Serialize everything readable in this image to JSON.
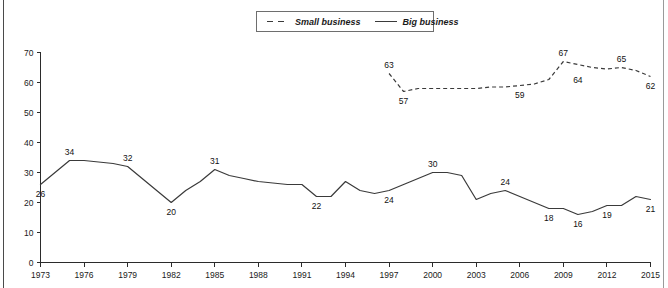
{
  "legend": {
    "position": "top-center",
    "entries": [
      {
        "label": "Small business",
        "style": "dashed",
        "swatch_name": "legend-swatch-dashed"
      },
      {
        "label": "Big business",
        "style": "solid",
        "swatch_name": "legend-swatch-solid"
      }
    ]
  },
  "axes": {
    "y_ticks": [
      "0",
      "10",
      "20",
      "30",
      "40",
      "50",
      "60",
      "70"
    ],
    "x_ticks": [
      "1973",
      "1976",
      "1979",
      "1982",
      "1985",
      "1988",
      "1991",
      "1994",
      "1997",
      "2000",
      "2003",
      "2006",
      "2009",
      "2012",
      "2015"
    ]
  },
  "chart_data": {
    "type": "line",
    "title": "",
    "xlabel": "",
    "ylabel": "",
    "xlim": [
      1973,
      2015
    ],
    "ylim": [
      0,
      70
    ],
    "grid": false,
    "legend_position": "top-center",
    "x": [
      1973,
      1974,
      1975,
      1976,
      1977,
      1978,
      1979,
      1980,
      1981,
      1982,
      1983,
      1984,
      1985,
      1986,
      1987,
      1988,
      1989,
      1990,
      1991,
      1992,
      1993,
      1994,
      1995,
      1996,
      1997,
      1998,
      1999,
      2000,
      2001,
      2002,
      2003,
      2004,
      2005,
      2006,
      2007,
      2008,
      2009,
      2010,
      2011,
      2012,
      2013,
      2014,
      2015
    ],
    "series": [
      {
        "name": "Big business",
        "style": "solid",
        "x": [
          1973,
          1974,
          1975,
          1976,
          1977,
          1978,
          1979,
          1980,
          1981,
          1982,
          1983,
          1984,
          1985,
          1986,
          1987,
          1988,
          1989,
          1990,
          1991,
          1992,
          1993,
          1994,
          1995,
          1996,
          1997,
          1998,
          1999,
          2000,
          2001,
          2002,
          2003,
          2004,
          2005,
          2006,
          2007,
          2008,
          2009,
          2010,
          2011,
          2012,
          2013,
          2014,
          2015
        ],
        "values": [
          26,
          30,
          34,
          34,
          33.5,
          33,
          32,
          28,
          24,
          20,
          24,
          27,
          31,
          29,
          28,
          27,
          26.5,
          26,
          26,
          22,
          22,
          27,
          24,
          23,
          24,
          26,
          28,
          30,
          30,
          29,
          21,
          23,
          24,
          22,
          20,
          18,
          18,
          16,
          17,
          19,
          19,
          22,
          21
        ]
      },
      {
        "name": "Small business",
        "style": "dashed",
        "x": [
          1997,
          1998,
          1999,
          2000,
          2001,
          2002,
          2003,
          2004,
          2005,
          2006,
          2007,
          2008,
          2009,
          2010,
          2011,
          2012,
          2013,
          2014,
          2015
        ],
        "values": [
          63,
          57,
          58,
          58,
          58,
          58,
          58,
          58.5,
          58.5,
          59,
          59.5,
          61,
          67,
          66,
          65,
          64.5,
          65,
          64,
          62
        ]
      }
    ],
    "point_labels": [
      {
        "series": "Big business",
        "x": 1973,
        "value": 26,
        "text": "26",
        "position": "below"
      },
      {
        "series": "Big business",
        "x": 1975,
        "value": 34,
        "text": "34",
        "position": "above"
      },
      {
        "series": "Big business",
        "x": 1979,
        "value": 32,
        "text": "32",
        "position": "above"
      },
      {
        "series": "Big business",
        "x": 1982,
        "value": 20,
        "text": "20",
        "position": "below"
      },
      {
        "series": "Big business",
        "x": 1985,
        "value": 31,
        "text": "31",
        "position": "above"
      },
      {
        "series": "Big business",
        "x": 1992,
        "value": 22,
        "text": "22",
        "position": "below"
      },
      {
        "series": "Big business",
        "x": 1997,
        "value": 24,
        "text": "24",
        "position": "below"
      },
      {
        "series": "Big business",
        "x": 2000,
        "value": 30,
        "text": "30",
        "position": "above"
      },
      {
        "series": "Big business",
        "x": 2005,
        "value": 24,
        "text": "24",
        "position": "above"
      },
      {
        "series": "Big business",
        "x": 2008,
        "value": 18,
        "text": "18",
        "position": "below"
      },
      {
        "series": "Big business",
        "x": 2010,
        "value": 16,
        "text": "16",
        "position": "below"
      },
      {
        "series": "Big business",
        "x": 2012,
        "value": 19,
        "text": "19",
        "position": "below"
      },
      {
        "series": "Big business",
        "x": 2015,
        "value": 21,
        "text": "21",
        "position": "below"
      },
      {
        "series": "Small business",
        "x": 1997,
        "value": 63,
        "text": "63",
        "position": "above"
      },
      {
        "series": "Small business",
        "x": 1998,
        "value": 57,
        "text": "57",
        "position": "below"
      },
      {
        "series": "Small business",
        "x": 2006,
        "value": 59,
        "text": "59",
        "position": "below"
      },
      {
        "series": "Small business",
        "x": 2009,
        "value": 67,
        "text": "67",
        "position": "above"
      },
      {
        "series": "Small business",
        "x": 2010,
        "value": 64,
        "text": "64",
        "position": "below"
      },
      {
        "series": "Small business",
        "x": 2013,
        "value": 65,
        "text": "65",
        "position": "above"
      },
      {
        "series": "Small business",
        "x": 2015,
        "value": 62,
        "text": "62",
        "position": "below"
      }
    ]
  }
}
